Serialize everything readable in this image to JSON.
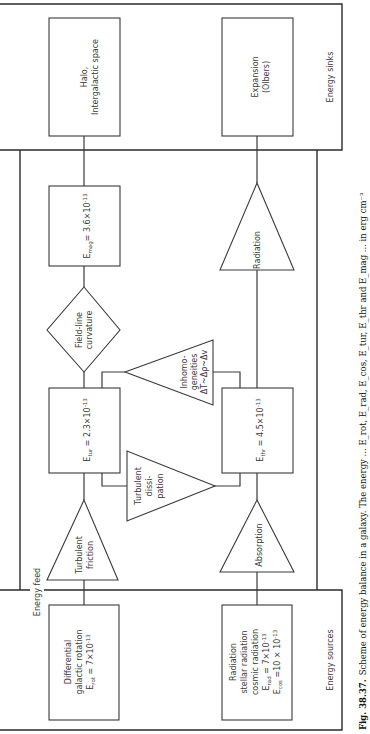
{
  "figure": {
    "orientation": "rotated 90° counter-clockwise (read bottom-to-top)",
    "regions": {
      "sources_label": "Energy sources",
      "sinks_label": "Energy sinks",
      "feed_label": "Energy feed"
    },
    "nodes": {
      "differential": {
        "line1": "Differential",
        "line2": "galactic rotation",
        "line3": "E",
        "sub": "rot",
        "line3_rest": " = 7×10",
        "exp": "-13"
      },
      "radiation_source": {
        "line1": "Radiation",
        "line2": "stellar radiation",
        "line3": "cosmic radiation",
        "e1": "E",
        "e1_sub": "rad",
        "e1_rest": " = 7×10",
        "e1_exp": "-13",
        "e2": "E",
        "e2_sub": "cos",
        "e2_rest": " =10 × 10",
        "e2_exp": "-13"
      },
      "turbulent_friction": {
        "line1": "Turbulent",
        "line2": "friction"
      },
      "absorption": {
        "line1": "Absorption"
      },
      "e_tur": {
        "e": "E",
        "sub": "tur",
        "rest": " = 2.3×10",
        "exp": "-13"
      },
      "e_thr": {
        "e": "E",
        "sub": "thr",
        "rest": " = 4.5×10",
        "exp": "-13"
      },
      "turbulent_dissipation": {
        "line1": "Turbulent",
        "line2": "dissi-",
        "line3": "pation"
      },
      "inhomogeneities": {
        "line1": "Inhomo-",
        "line2": "geneities",
        "line3": "ΔT~Δρ~Δv"
      },
      "field_line_curvature": {
        "line1": "Field-line",
        "line2": "curvature"
      },
      "radiation_sink": {
        "line1": "Radiation"
      },
      "e_mag": {
        "e": "E",
        "sub": "mag",
        "rest": "= 3.6×10",
        "exp": "-13"
      },
      "halo": {
        "line1": "Halo,",
        "line2": "Intergalactic space"
      },
      "expansion": {
        "line1": "Expansion",
        "line2": "(Olbers)"
      }
    },
    "caption": {
      "label": "Fig. 38.37.",
      "text": "Scheme of energy balance in a galaxy. The energy ... E_rot, E_rad, E_cos, E_tur, E_thr and E_mag ... in erg cm⁻³"
    }
  }
}
